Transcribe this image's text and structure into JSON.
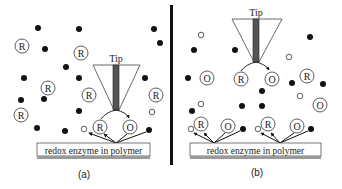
{
  "figure": {
    "colors": {
      "ink": "#111111",
      "tip_shaft": "#555555",
      "substrate": "#9a9a9a",
      "divider": "#111111"
    },
    "panels": [
      {
        "id": "a",
        "caption": "(a)",
        "tip_label": "Tip",
        "substrate_label": "redox enzyme in polymer",
        "tip_species_left": "R",
        "tip_species_right": "O",
        "surface_species_left": "R",
        "surface_species_right": "O",
        "bulk_species": [
          "R",
          "R",
          "R",
          "R",
          "R",
          "R"
        ]
      },
      {
        "id": "b",
        "caption": "(b)",
        "tip_label": "Tip",
        "substrate_label": "redox enzyme in polymer",
        "tip_species_left": "R",
        "tip_species_right": "O",
        "surface_species": [
          "R",
          "O",
          "R",
          "O"
        ],
        "bulk_species": [
          "O",
          "R",
          "O"
        ]
      }
    ]
  }
}
